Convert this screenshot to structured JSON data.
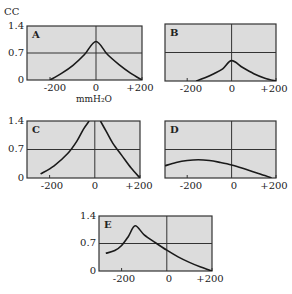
{
  "figure": {
    "y_unit": "CC",
    "x_unit": "mmH₂O",
    "colors": {
      "panel_bg": "#dcdcdc",
      "border": "#333333",
      "curve": "#1a1a1a"
    }
  },
  "chart_data": [
    {
      "type": "line",
      "title": "A",
      "ylabel": "CC",
      "xlabel": "mmH2O",
      "xlim": [
        -300,
        200
      ],
      "ylim": [
        0,
        1.4
      ],
      "xticks": [
        "-200",
        "0",
        "+200"
      ],
      "yticks": [
        "0",
        "0.7",
        "1.4"
      ],
      "gridlines": {
        "x": [
          0
        ],
        "y": [
          0.7
        ]
      },
      "x": [
        -200,
        -150,
        -100,
        -50,
        0,
        50,
        100,
        150,
        200
      ],
      "y": [
        0.0,
        0.17,
        0.38,
        0.66,
        1.0,
        0.66,
        0.4,
        0.18,
        0.0
      ]
    },
    {
      "type": "line",
      "title": "B",
      "ylabel": "CC",
      "xlabel": "mmH2O",
      "xlim": [
        -300,
        200
      ],
      "ylim": [
        0,
        1.4
      ],
      "xticks": [
        "-200",
        "0",
        "+200"
      ],
      "yticks": [
        "0",
        "0.7",
        "1.4"
      ],
      "gridlines": {
        "x": [
          0
        ],
        "y": [
          0.7
        ]
      },
      "x": [
        -160,
        -120,
        -80,
        -40,
        0,
        50,
        100,
        150,
        200
      ],
      "y": [
        0.0,
        0.08,
        0.18,
        0.3,
        0.5,
        0.33,
        0.18,
        0.07,
        0.0
      ]
    },
    {
      "type": "line",
      "title": "C",
      "ylabel": "CC",
      "xlabel": "mmH2O",
      "xlim": [
        -300,
        200
      ],
      "ylim": [
        0,
        1.4
      ],
      "xticks": [
        "-200",
        "0",
        "+200"
      ],
      "yticks": [
        "0",
        "0.7",
        "1.4"
      ],
      "gridlines": {
        "x": [
          0
        ],
        "y": [
          0.7
        ]
      },
      "segments": [
        {
          "x": [
            -240,
            -180,
            -120,
            -80,
            -50,
            -25
          ],
          "y": [
            0.1,
            0.3,
            0.6,
            0.9,
            1.2,
            1.4
          ]
        },
        {
          "x": [
            25,
            50,
            80,
            120,
            160,
            200
          ],
          "y": [
            1.4,
            1.15,
            0.85,
            0.55,
            0.25,
            0.0
          ]
        }
      ]
    },
    {
      "type": "line",
      "title": "D",
      "ylabel": "CC",
      "xlabel": "mmH2O",
      "xlim": [
        -300,
        200
      ],
      "ylim": [
        0,
        1.4
      ],
      "xticks": [
        "-200",
        "0",
        "+200"
      ],
      "yticks": [
        "0",
        "0.7",
        "1.4"
      ],
      "gridlines": {
        "x": [
          0
        ],
        "y": [
          0.7
        ]
      },
      "x": [
        -300,
        -250,
        -200,
        -150,
        -100,
        -50,
        0,
        50,
        100,
        150,
        180
      ],
      "y": [
        0.3,
        0.38,
        0.43,
        0.45,
        0.43,
        0.38,
        0.32,
        0.24,
        0.15,
        0.06,
        0.0
      ]
    },
    {
      "type": "line",
      "title": "E",
      "ylabel": "CC",
      "xlabel": "mmH2O",
      "xlim": [
        -300,
        200
      ],
      "ylim": [
        0,
        1.4
      ],
      "xticks": [
        "-200",
        "0",
        "+200"
      ],
      "yticks": [
        "0",
        "0.7",
        "1.4"
      ],
      "gridlines": {
        "x": [
          0
        ],
        "y": [
          0.7
        ]
      },
      "x": [
        -270,
        -230,
        -200,
        -170,
        -140,
        -100,
        -50,
        0,
        50,
        100,
        150,
        200
      ],
      "y": [
        0.45,
        0.52,
        0.65,
        0.88,
        1.15,
        0.92,
        0.72,
        0.53,
        0.36,
        0.22,
        0.1,
        0.0
      ]
    }
  ]
}
